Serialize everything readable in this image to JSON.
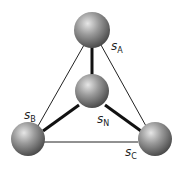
{
  "diagram": {
    "type": "tetrahedral-site-network",
    "nodes": [
      {
        "id": "A",
        "label_main": "s",
        "label_sub": "A",
        "x": 92,
        "y": 30
      },
      {
        "id": "N",
        "label_main": "s",
        "label_sub": "N",
        "x": 92,
        "y": 91
      },
      {
        "id": "B",
        "label_main": "s",
        "label_sub": "B",
        "x": 28,
        "y": 139
      },
      {
        "id": "C",
        "label_main": "s",
        "label_sub": "C",
        "x": 155,
        "y": 139
      }
    ],
    "edges": [
      {
        "from": "A",
        "to": "N",
        "style": "thick"
      },
      {
        "from": "B",
        "to": "N",
        "style": "thick"
      },
      {
        "from": "C",
        "to": "N",
        "style": "thick"
      },
      {
        "from": "A",
        "to": "B",
        "style": "thin"
      },
      {
        "from": "A",
        "to": "C",
        "style": "thin"
      },
      {
        "from": "B",
        "to": "C",
        "style": "thin"
      }
    ],
    "colors": {
      "sphere": "#8a8a8a",
      "edge": "#111111"
    }
  }
}
